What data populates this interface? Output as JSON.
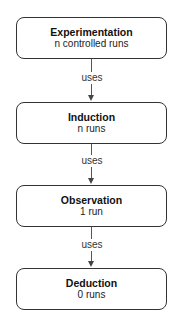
{
  "diagram": {
    "nodes": [
      {
        "title": "Experimentation",
        "subtitle": "n controlled runs"
      },
      {
        "title": "Induction",
        "subtitle": "n runs"
      },
      {
        "title": "Observation",
        "subtitle": "1 run"
      },
      {
        "title": "Deduction",
        "subtitle": "0 runs"
      }
    ],
    "edges": [
      {
        "from": "Experimentation",
        "to": "Induction",
        "label": "uses"
      },
      {
        "from": "Induction",
        "to": "Observation",
        "label": "uses"
      },
      {
        "from": "Observation",
        "to": "Deduction",
        "label": "uses"
      }
    ],
    "colors": {
      "border": "#333333",
      "text": "#111111",
      "background": "#ffffff"
    }
  }
}
